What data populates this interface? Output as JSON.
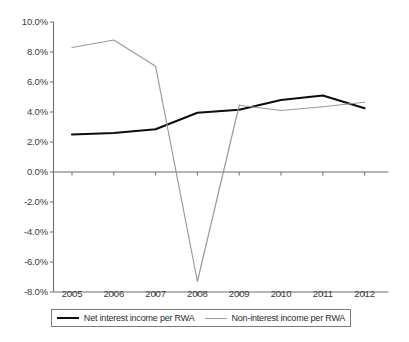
{
  "chart_data": {
    "type": "line",
    "title": "",
    "subtitle": "",
    "xlabel": "",
    "ylabel": "",
    "categories": [
      "2005",
      "2006",
      "2007",
      "2008",
      "2009",
      "2010",
      "2011",
      "2012"
    ],
    "x": [
      2005,
      2006,
      2007,
      2008,
      2009,
      2010,
      2011,
      2012
    ],
    "series": [
      {
        "name": "Net interest income per RWA",
        "color": "#0d0d0d",
        "values": [
          2.5,
          2.6,
          2.85,
          3.95,
          4.15,
          4.8,
          5.1,
          4.25
        ]
      },
      {
        "name": "Non-interest income per RWA",
        "color": "#9a9a9a",
        "values": [
          8.3,
          8.8,
          7.05,
          -7.3,
          4.45,
          4.1,
          4.35,
          4.65
        ]
      }
    ],
    "ylim": [
      -8.0,
      10.0
    ],
    "ytick_values": [
      10.0,
      8.0,
      6.0,
      4.0,
      2.0,
      0.0,
      -2.0,
      -4.0,
      -6.0,
      -8.0
    ],
    "ytick_labels": [
      "10.0%",
      "8.0%",
      "6.0%",
      "4.0%",
      "2.0%",
      "0.0%",
      "-2.0%",
      "-4.0%",
      "-6.0%",
      "-8.0%"
    ],
    "grid": false,
    "zero_line": true,
    "legend_position": "bottom"
  },
  "legend": {
    "entries": [
      {
        "label": "Net interest income per RWA"
      },
      {
        "label": "Non-interest income per RWA"
      }
    ]
  },
  "colors": {
    "series_net": "#0d0d0d",
    "series_non": "#9a9a9a",
    "axis": "#6e6e6e",
    "text": "#2b2b2b",
    "background": "#ffffff"
  }
}
